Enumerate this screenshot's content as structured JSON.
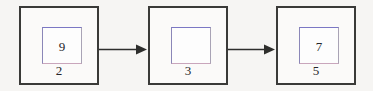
{
  "diagram": {
    "type": "linked-list-chain",
    "title": "",
    "background_color": "#f6f5f3",
    "node_border_color": "#3a3a38",
    "inner_box_border_color": "#7b77c4",
    "text_color": "#26262a",
    "arrow_color": "#2e2e2c",
    "nodes": [
      {
        "inner_value": "9",
        "label": "2"
      },
      {
        "inner_value": "",
        "label": "3"
      },
      {
        "inner_value": "7",
        "label": "5"
      }
    ],
    "arrows": [
      {
        "from": "node-1",
        "to": "node-2",
        "direction": "right"
      },
      {
        "from": "node-2",
        "to": "node-3",
        "direction": "right"
      }
    ]
  }
}
